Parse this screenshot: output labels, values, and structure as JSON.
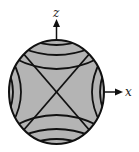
{
  "diagram": {
    "axes": {
      "vertical_label": "z",
      "horizontal_label": "x"
    },
    "colors": {
      "fill": "#b4b4b4",
      "stroke": "#111111",
      "background": "#ffffff"
    }
  }
}
